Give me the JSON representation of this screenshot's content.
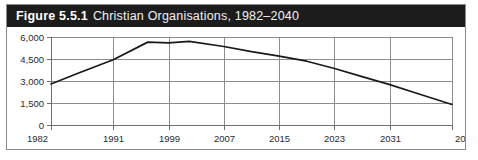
{
  "figure": {
    "number_label": "Figure 5.5.1",
    "caption": "Christian Organisations, 1982–2040",
    "titlebar_color": "#1c1c1c",
    "titlebar_text_color": "#ffffff",
    "frame_border_color": "#8b8b8b",
    "background_color": "#ffffff"
  },
  "chart_data": {
    "type": "line",
    "title": "Christian Organisations, 1982–2040",
    "subtitle": "",
    "xlabel": "",
    "ylabel": "",
    "grid": true,
    "legend": false,
    "legend_position": "none",
    "line_color": "#1a1a1a",
    "grid_color": "#8d8d8d",
    "xlim": [
      1982,
      2040
    ],
    "ylim": [
      0,
      6000
    ],
    "y_ticks": [
      0,
      1500,
      3000,
      4500,
      6000
    ],
    "y_tick_labels": [
      "0",
      "1,500",
      "3,000",
      "4,500",
      "6,000"
    ],
    "x_ticks": [
      1982,
      1991,
      1999,
      2007,
      2015,
      2023,
      2031,
      2040
    ],
    "x_tick_labels": [
      "1982",
      "1991",
      "1999",
      "2007",
      "2015",
      "2023",
      "2031",
      "2040"
    ],
    "series": [
      {
        "name": "Christian Organisations",
        "x": [
          1982,
          1986,
          1991,
          1996,
          1999,
          2002,
          2007,
          2011,
          2015,
          2019,
          2023,
          2027,
          2031,
          2035,
          2040
        ],
        "values": [
          2800,
          3550,
          4450,
          5650,
          5600,
          5700,
          5350,
          5000,
          4700,
          4350,
          3850,
          3300,
          2750,
          2150,
          1400
        ]
      }
    ]
  }
}
